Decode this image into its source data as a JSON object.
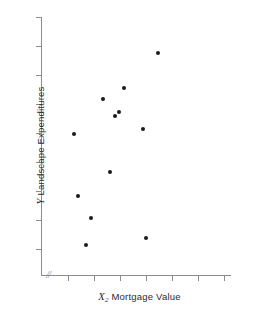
{
  "chart_data": {
    "type": "scatter",
    "title": "",
    "xlabel": "Mortgage Value",
    "xlabel_var": "X",
    "xlabel_var_sub": "2",
    "ylabel": "Landscape Expenditures",
    "ylabel_var": "Y",
    "axis_break_glyph": "//",
    "grid": false,
    "legend": null,
    "xlim": [
      0,
      1
    ],
    "ylim": [
      0,
      1
    ],
    "x_tick_count": 7,
    "y_tick_count": 9,
    "x_tick_labels": [
      "",
      "",
      "",
      "",
      "",
      "",
      ""
    ],
    "y_tick_labels": [
      "",
      "",
      "",
      "",
      "",
      "",
      "",
      "",
      ""
    ],
    "point_count": 12,
    "points": [
      {
        "px": 74,
        "py": 134
      },
      {
        "px": 78,
        "py": 196
      },
      {
        "px": 91,
        "py": 218
      },
      {
        "px": 103,
        "py": 99
      },
      {
        "px": 110,
        "py": 172
      },
      {
        "px": 115,
        "py": 116
      },
      {
        "px": 119,
        "py": 112
      },
      {
        "px": 124,
        "py": 88
      },
      {
        "px": 143,
        "py": 129
      },
      {
        "px": 146,
        "py": 238
      },
      {
        "px": 158,
        "py": 53
      },
      {
        "px": 86,
        "py": 245
      }
    ],
    "colors": {
      "marker": "#1a1a1a",
      "axis": "#8c8c8c",
      "text": "#2b2b2b",
      "background": "#ffffff"
    }
  },
  "axes": {
    "y_ticks_py": [
      17,
      46,
      75,
      104,
      133,
      162,
      191,
      220,
      249
    ],
    "x_ticks_px": [
      68,
      94,
      120,
      146,
      172,
      198,
      224
    ]
  }
}
